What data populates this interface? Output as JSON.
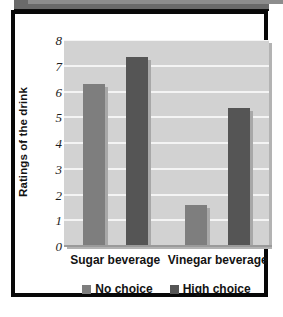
{
  "figure": {
    "frame_color": "#080808",
    "top_band_color": "#6a6a6a",
    "plot_background": "#d2d2d2",
    "gridline_color": "#f4f4f4"
  },
  "chart_data": {
    "type": "bar",
    "title": "",
    "xlabel": "",
    "ylabel": "Ratings of the drink",
    "categories": [
      "Sugar beverage",
      "Vinegar beverage"
    ],
    "series": [
      {
        "name": "No choice",
        "values": [
          6.3,
          1.6
        ],
        "color": "#7e7e7e"
      },
      {
        "name": "High choice",
        "values": [
          7.35,
          5.35
        ],
        "color": "#555555"
      }
    ],
    "ylim": [
      0,
      8
    ],
    "yticks": [
      0,
      1,
      2,
      3,
      4,
      5,
      6,
      7,
      8
    ],
    "ytick_labels": [
      "0",
      "1",
      "2",
      "3",
      "4",
      "5",
      "6",
      "7",
      "8"
    ],
    "grid": true,
    "grid_axis": "y",
    "legend_position": "bottom-center"
  }
}
